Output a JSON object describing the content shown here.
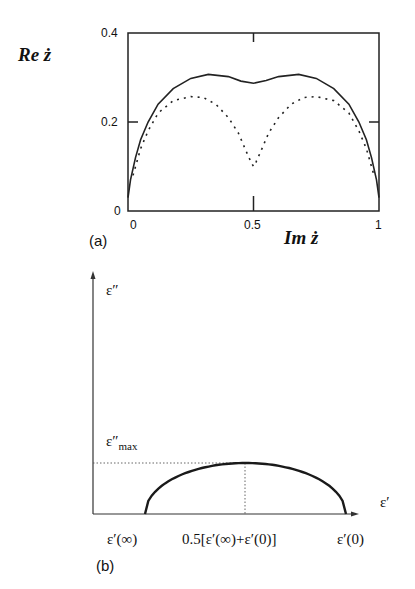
{
  "chart_data": [
    {
      "panel": "(a)",
      "type": "line",
      "title": "",
      "xlabel": "Im ż",
      "ylabel": "Re ż",
      "xlim": [
        0,
        1
      ],
      "ylim": [
        0,
        0.4
      ],
      "x_ticks": [
        "0",
        "0.5",
        "1"
      ],
      "y_ticks": [
        "0",
        "0.2",
        "0.4"
      ],
      "grid": false,
      "legend": null,
      "series": [
        {
          "name": "solid",
          "style": "solid",
          "x": [
            0,
            0.01,
            0.03,
            0.05,
            0.08,
            0.12,
            0.18,
            0.25,
            0.32,
            0.4,
            0.45,
            0.5,
            0.55,
            0.6,
            0.68,
            0.75,
            0.82,
            0.88,
            0.92,
            0.95,
            0.97,
            0.99,
            1
          ],
          "y": [
            0.03,
            0.07,
            0.12,
            0.16,
            0.2,
            0.24,
            0.275,
            0.298,
            0.307,
            0.302,
            0.292,
            0.287,
            0.293,
            0.302,
            0.307,
            0.298,
            0.275,
            0.24,
            0.2,
            0.16,
            0.12,
            0.07,
            0.03
          ]
        },
        {
          "name": "dotted",
          "style": "dotted",
          "x": [
            0.02,
            0.05,
            0.08,
            0.12,
            0.18,
            0.25,
            0.3,
            0.35,
            0.4,
            0.44,
            0.47,
            0.49,
            0.5,
            0.51,
            0.53,
            0.56,
            0.6,
            0.65,
            0.7,
            0.75,
            0.82,
            0.88,
            0.92,
            0.95,
            0.98
          ],
          "y": [
            0.08,
            0.14,
            0.18,
            0.22,
            0.248,
            0.257,
            0.255,
            0.24,
            0.21,
            0.175,
            0.135,
            0.11,
            0.1,
            0.11,
            0.135,
            0.175,
            0.21,
            0.24,
            0.255,
            0.257,
            0.248,
            0.22,
            0.18,
            0.14,
            0.08
          ]
        }
      ]
    },
    {
      "panel": "(b)",
      "type": "line",
      "title": "",
      "xlabel": "ε′",
      "ylabel": "ε″",
      "grid": false,
      "legend": null,
      "x_ticks": [
        "ε′(∞)",
        "0.5[ε′(∞)+ε′(0)]",
        "ε′(0)"
      ],
      "y_ticks": [
        "ε″max"
      ],
      "annotations": [
        "dotted horizontal at ε″max",
        "dotted vertical at 0.5[ε′(∞)+ε′(0)]"
      ],
      "series": [
        {
          "name": "semicircle arc",
          "style": "solid-thick",
          "x": [
            0,
            0.1,
            0.2,
            0.3,
            0.4,
            0.5,
            0.6,
            0.7,
            0.8,
            0.9,
            1
          ],
          "y": [
            0,
            0.6,
            0.8,
            0.917,
            0.98,
            1,
            0.98,
            0.917,
            0.8,
            0.6,
            0
          ]
        }
      ]
    }
  ],
  "panel_a": {
    "y_axis_label_main": "Re",
    "y_axis_label_var": "ż",
    "x_axis_label_main": "Im",
    "x_axis_label_var": "ż",
    "y_tick_0": "0",
    "y_tick_02": "0.2",
    "y_tick_04": "0.4",
    "x_tick_0": "0",
    "x_tick_05": "0.5",
    "x_tick_1": "1",
    "caption": "(a)"
  },
  "panel_b": {
    "y_axis_label": "ε″",
    "x_axis_label": "ε′",
    "ymax_label_main": "ε″",
    "ymax_label_sub": "max",
    "x_tick_left": "ε′(∞)",
    "x_tick_mid": "0.5[ε′(∞)+ε′(0)]",
    "x_tick_right": "ε′(0)",
    "caption": "(b)"
  }
}
